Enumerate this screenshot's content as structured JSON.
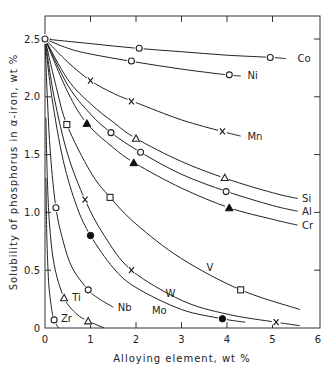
{
  "chart_data": {
    "type": "line",
    "title": "",
    "xlabel": "Alloying element, wt %",
    "ylabel": "Solubility of phosphorus in α-iron, wt %",
    "xlim": [
      0,
      6
    ],
    "ylim": [
      0,
      2.69
    ],
    "x_ticks": [
      0,
      1,
      2,
      3,
      4,
      5,
      6
    ],
    "x_tick_labels": [
      "0",
      "1",
      "2",
      "3",
      "4",
      "5",
      "6"
    ],
    "y_ticks": [
      0,
      0.5,
      1.0,
      1.5,
      2.0,
      2.5
    ],
    "y_tick_labels": [
      "0",
      "0.5",
      "1.0",
      "1.5",
      "2.0",
      "2.5"
    ],
    "grid": false,
    "legend": "inline curve labels",
    "origin_point": {
      "x": 0,
      "y": 2.5,
      "marker": "open-circle"
    },
    "series": [
      {
        "name": "Co",
        "marker": "open-circle",
        "points": [
          [
            0,
            2.5
          ],
          [
            2.07,
            2.42
          ],
          [
            4.95,
            2.34
          ]
        ],
        "curve": [
          [
            0,
            2.5
          ],
          [
            1,
            2.46
          ],
          [
            2,
            2.42
          ],
          [
            3,
            2.39
          ],
          [
            4,
            2.36
          ],
          [
            5,
            2.34
          ],
          [
            5.3,
            2.33
          ]
        ],
        "label_pos": [
          5.55,
          2.33
        ]
      },
      {
        "name": "Ni",
        "marker": "open-circle",
        "points": [
          [
            0,
            2.5
          ],
          [
            1.9,
            2.31
          ],
          [
            4.05,
            2.19
          ]
        ],
        "curve": [
          [
            0,
            2.5
          ],
          [
            0.5,
            2.42
          ],
          [
            1,
            2.37
          ],
          [
            2,
            2.3
          ],
          [
            3,
            2.24
          ],
          [
            4,
            2.19
          ],
          [
            4.3,
            2.18
          ]
        ],
        "label_pos": [
          4.45,
          2.18
        ]
      },
      {
        "name": "Mn",
        "marker": "cross",
        "points": [
          [
            1.0,
            2.14
          ],
          [
            1.9,
            1.96
          ],
          [
            3.9,
            1.7
          ]
        ],
        "curve": [
          [
            0,
            2.5
          ],
          [
            0.5,
            2.3
          ],
          [
            1,
            2.14
          ],
          [
            1.5,
            2.03
          ],
          [
            2,
            1.95
          ],
          [
            3,
            1.8
          ],
          [
            3.9,
            1.7
          ],
          [
            4.3,
            1.66
          ]
        ],
        "label_pos": [
          4.45,
          1.66
        ]
      },
      {
        "name": "Si",
        "marker": "open-triangle",
        "points": [
          [
            2.0,
            1.64
          ],
          [
            3.95,
            1.3
          ]
        ],
        "curve": [
          [
            0,
            2.5
          ],
          [
            0.5,
            2.15
          ],
          [
            1,
            1.94
          ],
          [
            1.5,
            1.78
          ],
          [
            2,
            1.64
          ],
          [
            3,
            1.44
          ],
          [
            4,
            1.29
          ],
          [
            5,
            1.17
          ],
          [
            5.55,
            1.12
          ]
        ],
        "label_pos": [
          5.65,
          1.12
        ]
      },
      {
        "name": "Al",
        "marker": "open-circle",
        "points": [
          [
            1.45,
            1.69
          ],
          [
            2.1,
            1.52
          ],
          [
            3.98,
            1.18
          ]
        ],
        "curve": [
          [
            0,
            2.5
          ],
          [
            0.5,
            2.1
          ],
          [
            1,
            1.85
          ],
          [
            1.45,
            1.69
          ],
          [
            2.1,
            1.52
          ],
          [
            3,
            1.33
          ],
          [
            4,
            1.18
          ],
          [
            5,
            1.06
          ],
          [
            5.55,
            1.01
          ]
        ],
        "label_pos": [
          5.65,
          1.01
        ]
      },
      {
        "name": "Cr",
        "marker": "filled-triangle",
        "points": [
          [
            0.92,
            1.77
          ],
          [
            1.95,
            1.43
          ],
          [
            4.05,
            1.04
          ]
        ],
        "curve": [
          [
            0,
            2.5
          ],
          [
            0.5,
            2.04
          ],
          [
            0.92,
            1.77
          ],
          [
            1.5,
            1.56
          ],
          [
            2,
            1.42
          ],
          [
            3,
            1.21
          ],
          [
            4.05,
            1.04
          ],
          [
            5,
            0.94
          ],
          [
            5.55,
            0.89
          ]
        ],
        "label_pos": [
          5.65,
          0.89
        ]
      },
      {
        "name": "V",
        "marker": "open-square",
        "points": [
          [
            0.48,
            1.76
          ],
          [
            1.43,
            1.13
          ],
          [
            4.3,
            0.33
          ]
        ],
        "curve": [
          [
            0,
            2.5
          ],
          [
            0.25,
            2.08
          ],
          [
            0.48,
            1.76
          ],
          [
            1,
            1.35
          ],
          [
            1.43,
            1.13
          ],
          [
            2,
            0.9
          ],
          [
            3,
            0.6
          ],
          [
            4.3,
            0.33
          ],
          [
            5.6,
            0.16
          ]
        ],
        "label_pos": [
          3.55,
          0.52
        ]
      },
      {
        "name": "W",
        "marker": "cross",
        "points": [
          [
            0.88,
            1.11
          ],
          [
            1.9,
            0.5
          ],
          [
            5.08,
            0.05
          ]
        ],
        "curve": [
          [
            0,
            2.5
          ],
          [
            0.2,
            2.0
          ],
          [
            0.5,
            1.5
          ],
          [
            0.88,
            1.11
          ],
          [
            1.3,
            0.8
          ],
          [
            1.9,
            0.5
          ],
          [
            3,
            0.24
          ],
          [
            4,
            0.12
          ],
          [
            5.08,
            0.05
          ],
          [
            5.6,
            0.02
          ]
        ],
        "label_pos": [
          2.65,
          0.3
        ]
      },
      {
        "name": "Mo",
        "marker": "filled-circle",
        "points": [
          [
            1.0,
            0.8
          ],
          [
            3.9,
            0.08
          ]
        ],
        "curve": [
          [
            0,
            2.5
          ],
          [
            0.15,
            2.0
          ],
          [
            0.4,
            1.45
          ],
          [
            0.7,
            1.05
          ],
          [
            1.0,
            0.8
          ],
          [
            1.5,
            0.52
          ],
          [
            2,
            0.35
          ],
          [
            3,
            0.16
          ],
          [
            3.9,
            0.08
          ],
          [
            4.4,
            0.05
          ]
        ],
        "label_pos": [
          2.35,
          0.15
        ]
      },
      {
        "name": "Nb",
        "marker": "open-circle",
        "points": [
          [
            0.24,
            1.04
          ],
          [
            0.95,
            0.33
          ]
        ],
        "curve": [
          [
            0,
            2.5
          ],
          [
            0.05,
            2.0
          ],
          [
            0.12,
            1.5
          ],
          [
            0.24,
            1.04
          ],
          [
            0.4,
            0.75
          ],
          [
            0.6,
            0.52
          ],
          [
            0.95,
            0.33
          ],
          [
            1.2,
            0.25
          ],
          [
            1.5,
            0.18
          ]
        ],
        "label_pos": [
          1.6,
          0.18
        ]
      },
      {
        "name": "Ti",
        "marker": "open-triangle",
        "points": [
          [
            0.42,
            0.26
          ],
          [
            0.95,
            0.06
          ]
        ],
        "curve": [
          [
            0.02,
            1.82
          ],
          [
            0.05,
            1.3
          ],
          [
            0.1,
            0.9
          ],
          [
            0.2,
            0.55
          ],
          [
            0.42,
            0.26
          ],
          [
            0.7,
            0.12
          ],
          [
            0.95,
            0.06
          ],
          [
            1.3,
            0.0
          ]
        ],
        "label_pos": [
          0.6,
          0.26
        ]
      },
      {
        "name": "Zr",
        "marker": "open-circle",
        "points": [
          [
            0.2,
            0.07
          ]
        ],
        "curve": [
          [
            0.02,
            1.3
          ],
          [
            0.04,
            0.8
          ],
          [
            0.08,
            0.4
          ],
          [
            0.14,
            0.18
          ],
          [
            0.2,
            0.07
          ],
          [
            0.3,
            0.0
          ]
        ],
        "label_pos": [
          0.35,
          0.08
        ]
      }
    ]
  }
}
